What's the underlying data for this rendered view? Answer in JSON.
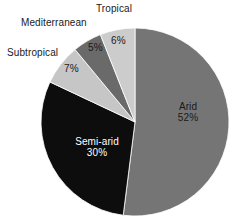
{
  "chart_data": {
    "type": "pie",
    "title": "",
    "categories": [
      "Arid",
      "Semi-arid",
      "Subtropical",
      "Mediterranean",
      "Tropical"
    ],
    "values": [
      52,
      30,
      7,
      5,
      6
    ],
    "value_suffix": "%",
    "legend": "none",
    "start_angle_deg": 0,
    "direction": "clockwise",
    "colors": [
      "#757575",
      "#0d0d0d",
      "#c6c6c6",
      "#6a6a6a",
      "#cccccc"
    ],
    "background": "#ffffff",
    "slices": [
      {
        "name": "Arid",
        "label": "Arid",
        "percent": 52,
        "percent_text": "52%",
        "color": "#757575",
        "label_placement": "inside",
        "label_color": "#1a1a1a"
      },
      {
        "name": "Semi-arid",
        "label": "Semi-arid",
        "percent": 30,
        "percent_text": "30%",
        "color": "#0d0d0d",
        "label_placement": "inside",
        "label_color": "#ffffff"
      },
      {
        "name": "Subtropical",
        "label": "Subtropical",
        "percent": 7,
        "percent_text": "7%",
        "color": "#c6c6c6",
        "label_placement": "outside",
        "label_color": "#1a1a1a"
      },
      {
        "name": "Mediterranean",
        "label": "Mediterranean",
        "percent": 5,
        "percent_text": "5%",
        "color": "#6a6a6a",
        "label_placement": "outside",
        "label_color": "#1a1a1a"
      },
      {
        "name": "Tropical",
        "label": "Tropical",
        "percent": 6,
        "percent_text": "6%",
        "color": "#cccccc",
        "label_placement": "outside",
        "label_color": "#1a1a1a"
      }
    ]
  }
}
